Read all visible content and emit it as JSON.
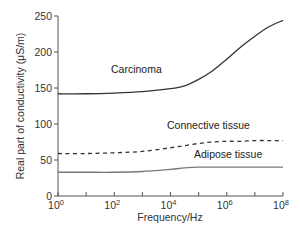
{
  "chart_data": {
    "type": "line",
    "title": "",
    "xlabel": "Frequency/Hz",
    "ylabel": "Real part of conductivity (μS/m)",
    "xscale": "log",
    "xlim": [
      1,
      100000000
    ],
    "ylim": [
      0,
      250
    ],
    "grid": false,
    "legend": "inline labels",
    "x_ticks": [
      {
        "base": "10",
        "exp": "0"
      },
      {
        "base": "10",
        "exp": "2"
      },
      {
        "base": "10",
        "exp": "4"
      },
      {
        "base": "10",
        "exp": "6"
      },
      {
        "base": "10",
        "exp": "8"
      }
    ],
    "y_ticks": [
      "0",
      "50",
      "100",
      "150",
      "200",
      "250"
    ],
    "x_log10": [
      0,
      1,
      2,
      3,
      4,
      4.5,
      5,
      5.5,
      6,
      6.5,
      7,
      7.5,
      8
    ],
    "series": [
      {
        "name": "Carcinoma",
        "style": "solid",
        "color": "#333333",
        "values": [
          142,
          142,
          143,
          145,
          149,
          153,
          162,
          174,
          190,
          207,
          222,
          235,
          244
        ]
      },
      {
        "name": "Connective tissue",
        "style": "dashed",
        "color": "#333333",
        "values": [
          59,
          59,
          60,
          62,
          67,
          70,
          73,
          75,
          76,
          76,
          77,
          77,
          77
        ]
      },
      {
        "name": "Adipose tissue",
        "style": "solid",
        "color": "#777777",
        "values": [
          33,
          33,
          33,
          34,
          37,
          39,
          40,
          40,
          40,
          40,
          40,
          40,
          40
        ]
      }
    ]
  }
}
